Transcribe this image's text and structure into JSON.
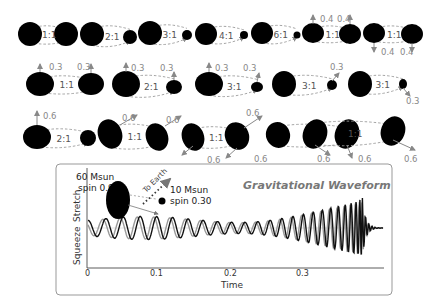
{
  "rows": [
    {
      "pairs": [
        {
          "ratio": "1:1",
          "big": {
            "cx": 30,
            "cy": 34,
            "rx": 12,
            "ry": 12
          },
          "small": {
            "cx": 66,
            "cy": 34,
            "rx": 12,
            "ry": 12
          }
        },
        {
          "ratio": "2:1",
          "big": {
            "cx": 92,
            "cy": 34,
            "rx": 12,
            "ry": 12
          },
          "small": {
            "cx": 130,
            "cy": 37,
            "rx": 7,
            "ry": 7
          }
        },
        {
          "ratio": "3:1",
          "big": {
            "cx": 150,
            "cy": 33,
            "rx": 12,
            "ry": 12
          },
          "small": {
            "cx": 187,
            "cy": 35,
            "rx": 5,
            "ry": 5
          }
        },
        {
          "ratio": "4:1",
          "big": {
            "cx": 206,
            "cy": 34,
            "rx": 11,
            "ry": 11
          },
          "small": {
            "cx": 244,
            "cy": 35,
            "rx": 4,
            "ry": 4
          }
        },
        {
          "ratio": "6:1",
          "big": {
            "cx": 262,
            "cy": 33,
            "rx": 11,
            "ry": 11
          },
          "small": {
            "cx": 297,
            "cy": 35,
            "rx": 3.5,
            "ry": 3.5
          }
        },
        {
          "ratio": "1:1",
          "big": {
            "cx": 313,
            "cy": 33,
            "rx": 11,
            "ry": 10
          },
          "small": {
            "cx": 350,
            "cy": 34,
            "rx": 11,
            "ry": 10
          }
        },
        {
          "ratio": "1:1",
          "big": {
            "cx": 374,
            "cy": 33,
            "rx": 11,
            "ry": 10
          },
          "small": {
            "cx": 412,
            "cy": 34,
            "rx": 11,
            "ry": 10
          }
        }
      ],
      "spin_labels": [
        {
          "text": "0.4",
          "x": 320,
          "y": 22
        },
        {
          "text": "0.4",
          "x": 337,
          "y": 22
        },
        {
          "text": "0.4",
          "x": 381,
          "y": 55
        },
        {
          "text": "0.4",
          "x": 400,
          "y": 55
        }
      ]
    },
    {
      "pairs": [
        {
          "ratio": "1:1",
          "big": {
            "cx": 40,
            "cy": 84,
            "rx": 14,
            "ry": 12
          },
          "small": {
            "cx": 91,
            "cy": 84,
            "rx": 13,
            "ry": 11
          }
        },
        {
          "ratio": "2:1",
          "big": {
            "cx": 126,
            "cy": 84,
            "rx": 14,
            "ry": 13
          },
          "small": {
            "cx": 174,
            "cy": 87,
            "rx": 8,
            "ry": 7
          }
        },
        {
          "ratio": "3:1",
          "big": {
            "cx": 209,
            "cy": 84,
            "rx": 14,
            "ry": 12
          },
          "small": {
            "cx": 257,
            "cy": 87,
            "rx": 6,
            "ry": 5
          }
        },
        {
          "ratio": "3:1",
          "big": {
            "cx": 284,
            "cy": 84,
            "rx": 12,
            "ry": 13
          },
          "small": {
            "cx": 332,
            "cy": 85,
            "rx": 5,
            "ry": 5
          }
        },
        {
          "ratio": "3:1",
          "big": {
            "cx": 360,
            "cy": 84,
            "rx": 12,
            "ry": 13
          },
          "small": {
            "cx": 403,
            "cy": 84,
            "rx": 4,
            "ry": 5
          }
        }
      ],
      "spin_labels": [
        {
          "text": "0.3",
          "x": 49,
          "y": 70
        },
        {
          "text": "0.3",
          "x": 77,
          "y": 70
        },
        {
          "text": "0.3",
          "x": 131,
          "y": 71
        },
        {
          "text": "0.3",
          "x": 160,
          "y": 71
        },
        {
          "text": "0.3",
          "x": 215,
          "y": 71
        },
        {
          "text": "0.3",
          "x": 243,
          "y": 71
        },
        {
          "text": "0.3",
          "x": 330,
          "y": 70
        },
        {
          "text": "0.3",
          "x": 406,
          "y": 104
        }
      ]
    },
    {
      "pairs": [
        {
          "ratio": "2:1",
          "big": {
            "cx": 37,
            "cy": 137,
            "rx": 14,
            "ry": 12
          },
          "small": {
            "cx": 88,
            "cy": 138,
            "rx": 8,
            "ry": 8
          }
        },
        {
          "ratio": "1:1",
          "big": {
            "cx": 110,
            "cy": 134,
            "rx": 12,
            "ry": 15,
            "rot": -20
          },
          "small": {
            "cx": 157,
            "cy": 137,
            "rx": 11,
            "ry": 14,
            "rot": -20
          }
        },
        {
          "ratio": "1:1",
          "big": {
            "cx": 193,
            "cy": 137,
            "rx": 11,
            "ry": 14,
            "rot": -20
          },
          "small": {
            "cx": 237,
            "cy": 136,
            "rx": 12,
            "ry": 14,
            "rot": -20
          }
        },
        {
          "ratio": "1:1",
          "big": {
            "cx": 278,
            "cy": 135,
            "rx": 12,
            "ry": 13,
            "rot": -20
          },
          "small": {
            "cx": 347,
            "cy": 134,
            "rx": 12,
            "ry": 15,
            "rot": 20
          }
        },
        {
          "ratio": "1:1",
          "big": {
            "cx": 315,
            "cy": 134,
            "rx": 12,
            "ry": 15,
            "rot": 20
          },
          "small": {
            "cx": 393,
            "cy": 131,
            "rx": 12,
            "ry": 15,
            "rot": 20
          }
        }
      ],
      "spin_labels": [
        {
          "text": "0.6",
          "x": 43,
          "y": 119
        },
        {
          "text": "0.6",
          "x": 122,
          "y": 121
        },
        {
          "text": "0.6",
          "x": 166,
          "y": 123
        },
        {
          "text": "0.6",
          "x": 207,
          "y": 163
        },
        {
          "text": "0.6",
          "x": 246,
          "y": 116
        },
        {
          "text": "0.6",
          "x": 254,
          "y": 162
        },
        {
          "text": "0.6",
          "x": 317,
          "y": 162
        },
        {
          "text": "0.6",
          "x": 358,
          "y": 162
        },
        {
          "text": "0.6",
          "x": 404,
          "y": 162
        }
      ]
    }
  ],
  "waveform_panel": {
    "title": "Gravitational Waveform",
    "ylabel_top": "Stretch",
    "ylabel_bottom": "Squeeze",
    "xlabel": "Time",
    "xticks": [
      "0",
      "0.1",
      "0.2",
      "0.3"
    ],
    "inset": {
      "big_mass": "60 Msun",
      "big_spin": "spin 0.91",
      "small_mass": "10 Msun",
      "small_spin": "spin 0.30",
      "direction_label": "To Earth"
    },
    "colors": {
      "waveform_primary": "#111111",
      "waveform_secondary": "#999999",
      "frame": "#888888"
    }
  },
  "chart_data": {
    "type": "line",
    "title": "Gravitational Waveform",
    "xlabel": "Time",
    "ylabel": "Stretch / Squeeze",
    "xlim": [
      0,
      0.37
    ],
    "xticks": [
      0,
      0.1,
      0.2,
      0.3
    ],
    "series": [
      {
        "name": "waveform (black)",
        "description": "chirp, ~11 cycles growing in amplitude and frequency, merger peak near t=0.345"
      },
      {
        "name": "waveform (gray)",
        "description": "comparison waveform, similar chirp slightly out of phase"
      }
    ],
    "annotations": [
      "60 Msun spin 0.91",
      "10 Msun spin 0.30",
      "To Earth"
    ]
  }
}
